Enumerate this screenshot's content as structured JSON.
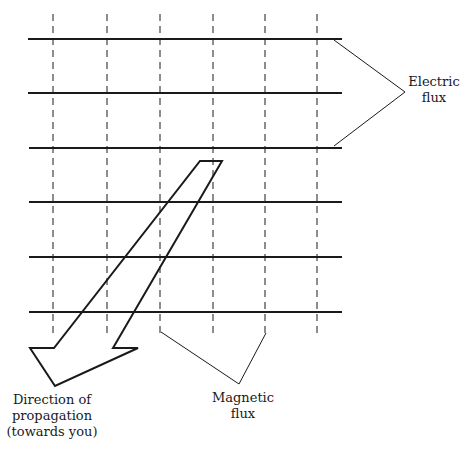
{
  "diagram": {
    "labels": {
      "electric": [
        "Electric",
        "flux"
      ],
      "magnetic": [
        "Magnetic",
        "flux"
      ],
      "direction": [
        "Direction of",
        "propagation",
        "(towards you)"
      ]
    },
    "colors": {
      "line": "#1a1a1a",
      "background": "#ffffff"
    },
    "electric_lines_y": [
      39,
      93,
      148,
      202,
      257,
      312
    ],
    "magnetic_lines_x": [
      53,
      107,
      160,
      213,
      265,
      317
    ]
  }
}
